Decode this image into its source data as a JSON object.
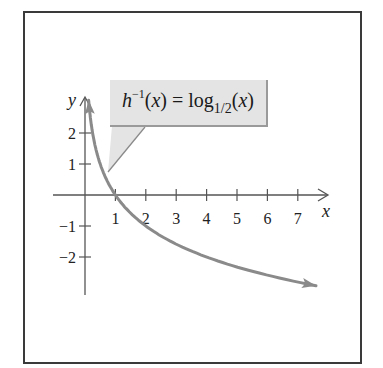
{
  "chart_data": {
    "type": "line",
    "title": "",
    "function": "h^{-1}(x) = log_{1/2}(x)",
    "annotation": {
      "fn": "h",
      "inverse_exp": "−1",
      "var": "x",
      "eq": "=",
      "log": "log",
      "base": "1/2"
    },
    "xlabel": "x",
    "ylabel": "y",
    "xlim": [
      -1,
      8
    ],
    "ylim": [
      -3.3,
      3.2
    ],
    "x_ticks": [
      1,
      2,
      3,
      4,
      5,
      6,
      7
    ],
    "x_tick_labels": [
      "1",
      "2",
      "3",
      "4",
      "5",
      "6",
      "7"
    ],
    "y_ticks": [
      -2,
      -1,
      1,
      2
    ],
    "y_tick_labels": [
      "−2",
      "−1",
      "1",
      "2"
    ],
    "grid": false,
    "series": [
      {
        "name": "log_{1/2}(x)",
        "color": "#8a8a8a",
        "x": [
          0.12,
          0.25,
          0.5,
          0.75,
          1,
          1.5,
          2,
          3,
          4,
          5,
          6,
          7,
          7.6
        ],
        "y": [
          3.06,
          2,
          1,
          0.42,
          0,
          -0.58,
          -1,
          -1.58,
          -2,
          -2.32,
          -2.58,
          -2.81,
          -2.93
        ]
      }
    ],
    "colors": {
      "axis": "#555555",
      "curve": "#8a8a8a",
      "callout_bg": "#e4e4e4",
      "frame": "#3a3a3a"
    }
  }
}
